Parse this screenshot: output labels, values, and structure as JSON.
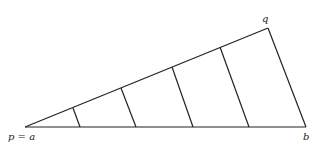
{
  "labels": {
    "pa": "p = a",
    "q": "q",
    "b": "b"
  },
  "points": {
    "a": [
      25,
      127
    ],
    "q": [
      268,
      28
    ],
    "b": [
      306,
      127
    ]
  },
  "divisions": [
    [
      [
        73,
        108
      ],
      [
        80,
        127
      ]
    ],
    [
      [
        121,
        88
      ],
      [
        136,
        127
      ]
    ],
    [
      [
        172,
        67
      ],
      [
        193,
        127
      ]
    ],
    [
      [
        220,
        47
      ],
      [
        249,
        127
      ]
    ]
  ],
  "colors": {
    "stroke": "#222222"
  }
}
